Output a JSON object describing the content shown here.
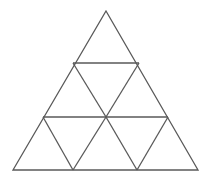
{
  "figure": {
    "name": "subdivided-equilateral-triangle",
    "background_color": "#ffffff",
    "line_color": "#595959",
    "line_width": 1.3,
    "canvas": {
      "width": 210,
      "height": 179
    },
    "rows": 3,
    "small_triangle_count": 9,
    "upward_triangle_count": 6,
    "downward_triangle_count": 3,
    "vertices": {
      "apex": {
        "x": 106,
        "y": 11
      },
      "bottom_left": {
        "x": 13,
        "y": 170
      },
      "bottom_right": {
        "x": 198,
        "y": 170
      },
      "row1_left": {
        "x": 73,
        "y": 63
      },
      "row1_right": {
        "x": 139,
        "y": 63
      },
      "row2_left": {
        "x": 43,
        "y": 117
      },
      "row2_center": {
        "x": 106,
        "y": 117
      },
      "row2_right": {
        "x": 168,
        "y": 117
      },
      "base_left_third": {
        "x": 73,
        "y": 170
      },
      "base_right_third": {
        "x": 137,
        "y": 170
      }
    },
    "outline_path": "M106,11 L198,170 L13,170 Z",
    "horizontal_lines": [
      {
        "name": "upper-horizontal",
        "x1": 73,
        "y1": 63,
        "x2": 139,
        "y2": 63
      },
      {
        "name": "lower-horizontal",
        "x1": 43,
        "y1": 117,
        "x2": 168,
        "y2": 117
      }
    ],
    "left_leaning_lines": [
      {
        "name": "left-lean-upper",
        "x1": 139,
        "y1": 63,
        "x2": 106,
        "y2": 117
      },
      {
        "name": "left-lean-mid",
        "x1": 168,
        "y1": 117,
        "x2": 137,
        "y2": 170
      },
      {
        "name": "left-lean-lower",
        "x1": 106,
        "y1": 117,
        "x2": 73,
        "y2": 170
      }
    ],
    "right_leaning_lines": [
      {
        "name": "right-lean-upper",
        "x1": 73,
        "y1": 63,
        "x2": 106,
        "y2": 117
      },
      {
        "name": "right-lean-mid",
        "x1": 43,
        "y1": 117,
        "x2": 73,
        "y2": 170
      },
      {
        "name": "right-lean-lower",
        "x1": 106,
        "y1": 117,
        "x2": 137,
        "y2": 170
      }
    ]
  }
}
